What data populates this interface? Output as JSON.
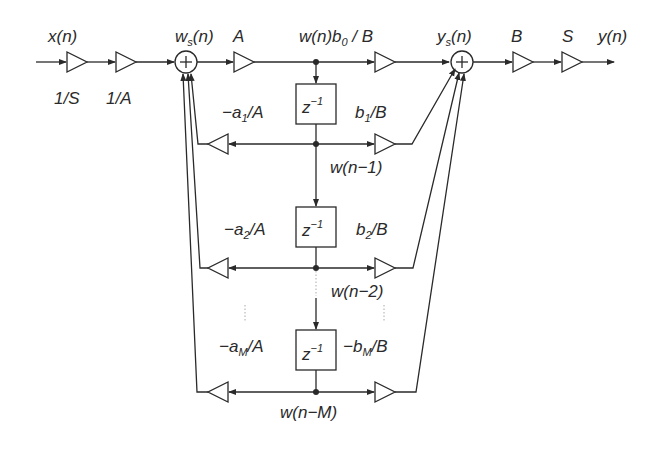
{
  "diagram": {
    "inputs": {
      "x": "x(n)"
    },
    "outputs": {
      "y": "y(n)"
    },
    "labels": {
      "input_gain_1": "1/S",
      "input_gain_2": "1/A",
      "ws": "w",
      "ws_sub": "s",
      "ws_tail": "(n)",
      "gain_A": "A",
      "b0_prefix": "w(n)b",
      "b0_sub": "0",
      "b0_tail": " / B",
      "ys": "y",
      "ys_sub": "s",
      "ys_tail": "(n)",
      "gain_B": "B",
      "gain_S": "S",
      "a1_prefix": "−a",
      "a1_sub": "1",
      "a1_tail": "/A",
      "b1_prefix": "b",
      "b1_sub": "1",
      "b1_tail": "/B",
      "a2_prefix": "−a",
      "a2_sub": "2",
      "a2_tail": "/A",
      "b2_prefix": "b",
      "b2_sub": "2",
      "b2_tail": "/B",
      "aM_prefix": "−a",
      "aM_sub": "M",
      "aM_tail": "/A",
      "bM_prefix": "−b",
      "bM_sub": "M",
      "bM_tail": "/B",
      "delay": "z",
      "delay_sup": "−1",
      "w1": "w(n−1)",
      "w2": "w(n−2)",
      "wM": "w(n−M)",
      "sum_symbol": "+"
    },
    "colors": {
      "ink": "#2a2a2a",
      "dotted": "#aaaaaa",
      "background": "#ffffff"
    }
  }
}
